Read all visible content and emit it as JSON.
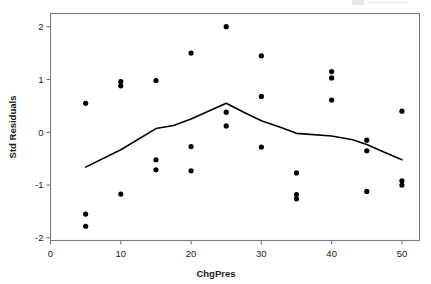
{
  "chart_data": {
    "type": "scatter",
    "title": "",
    "xlabel": "ChgPres",
    "ylabel": "Std Residuals",
    "xlim": [
      0,
      52.5
    ],
    "ylim": [
      -2.05,
      2.25
    ],
    "xticks": [
      0,
      10,
      20,
      30,
      40,
      50
    ],
    "xtick_labels": [
      "0",
      "10",
      "20",
      "30",
      "40",
      "50"
    ],
    "yticks": [
      -2,
      -1,
      0,
      1,
      2
    ],
    "ytick_labels": [
      "-2",
      "-1",
      "0",
      "1",
      "2"
    ],
    "grid": false,
    "legend": false,
    "marker": "filled-circle",
    "marker_color": "#000000",
    "line_color": "#000000",
    "frame_color": "#7a7a7a",
    "background": "#ffffff",
    "points": [
      {
        "x": 5,
        "y": 0.55
      },
      {
        "x": 5,
        "y": -1.55
      },
      {
        "x": 5,
        "y": -1.78
      },
      {
        "x": 10,
        "y": 0.96
      },
      {
        "x": 10,
        "y": 0.88
      },
      {
        "x": 10,
        "y": -1.17
      },
      {
        "x": 15,
        "y": 0.98
      },
      {
        "x": 15,
        "y": -0.52
      },
      {
        "x": 15,
        "y": -0.71
      },
      {
        "x": 20,
        "y": 1.5
      },
      {
        "x": 20,
        "y": -0.27
      },
      {
        "x": 20,
        "y": -0.73
      },
      {
        "x": 25,
        "y": 2.0
      },
      {
        "x": 25,
        "y": 0.38
      },
      {
        "x": 25,
        "y": 0.12
      },
      {
        "x": 30,
        "y": 1.45
      },
      {
        "x": 30,
        "y": 0.68
      },
      {
        "x": 30,
        "y": -0.28
      },
      {
        "x": 35,
        "y": -0.77
      },
      {
        "x": 35,
        "y": -1.18
      },
      {
        "x": 35,
        "y": -1.26
      },
      {
        "x": 40,
        "y": 1.15
      },
      {
        "x": 40,
        "y": 1.03
      },
      {
        "x": 40,
        "y": 0.61
      },
      {
        "x": 45,
        "y": -0.15
      },
      {
        "x": 45,
        "y": -0.35
      },
      {
        "x": 45,
        "y": -1.12
      },
      {
        "x": 50,
        "y": 0.4
      },
      {
        "x": 50,
        "y": -0.92
      },
      {
        "x": 50,
        "y": -1.0
      }
    ],
    "series": [
      {
        "name": "fit-line",
        "type": "line",
        "x": [
          5,
          10,
          15,
          17.5,
          20,
          25,
          27.5,
          30,
          33,
          35,
          40,
          43,
          45,
          47.5,
          50
        ],
        "y": [
          -0.66,
          -0.33,
          0.07,
          0.13,
          0.25,
          0.55,
          0.38,
          0.22,
          0.08,
          -0.02,
          -0.07,
          -0.14,
          -0.23,
          -0.38,
          -0.52
        ]
      }
    ]
  }
}
